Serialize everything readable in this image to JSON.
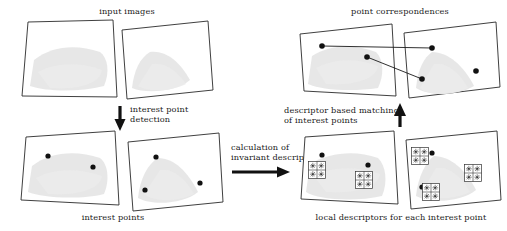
{
  "figure": {
    "background_color": "#ffffff",
    "ink_color": "#1a1a1a",
    "blob_color": "#e3e3e3",
    "width": 507,
    "height": 231
  },
  "captions": {
    "input_images": "input images",
    "interest_points": "interest points",
    "point_correspondences": "point correspondences",
    "local_descriptors": "local descriptors for each interest point",
    "interest_point_detection_line1": "interest point",
    "interest_point_detection_line2": "detection",
    "calculation_line1": "calculation of",
    "calculation_line2": "invariant descriptors",
    "matching_line1": "descriptor based matching",
    "matching_line2": "of interest points"
  },
  "panels": [
    {
      "id": "input-images",
      "caption_key": "input_images",
      "caption_position": "top",
      "quads": [
        {
          "id": "input-left",
          "points": "28,22 113,20 117,97 22,96",
          "blob": "M 34,60 C 52,46 76,44 100,52 C 108,58 110,72 104,86 C 80,92 48,92 30,86 Z"
        },
        {
          "id": "input-right",
          "points": "122,30 208,21 213,90 127,99",
          "blob": "M 150,52 C 166,50 180,62 190,80 C 176,92 146,94 132,88 C 134,70 140,58 150,52 Z"
        }
      ],
      "points": []
    },
    {
      "id": "interest-points",
      "caption_key": "interest_points",
      "caption_position": "bottom",
      "quads": [
        {
          "id": "ip-left",
          "points": "26,137 115,131 119,205 21,200",
          "blob": "M 32,166 C 50,152 76,150 100,158 C 108,164 110,180 104,194 C 80,200 42,198 28,192 Z"
        },
        {
          "id": "ip-right",
          "points": "128,142 219,133 223,202 133,211",
          "blob": "M 158,158 C 174,158 188,172 198,192 C 184,204 152,206 138,198 C 140,178 148,164 158,158 Z"
        }
      ],
      "points": [
        {
          "panel": "ip-left",
          "x": 48,
          "y": 156
        },
        {
          "panel": "ip-left",
          "x": 93,
          "y": 167
        },
        {
          "panel": "ip-right",
          "x": 156,
          "y": 157
        },
        {
          "panel": "ip-right",
          "x": 145,
          "y": 190
        },
        {
          "panel": "ip-right",
          "x": 200,
          "y": 183
        }
      ]
    },
    {
      "id": "point-correspondences",
      "caption_key": "point_correspondences",
      "caption_position": "top",
      "quads": [
        {
          "id": "pc-left",
          "points": "300,34 392,24 396,96 304,91",
          "blob": "M 312,56 C 330,44 356,44 376,52 C 384,60 384,76 378,88 C 352,92 320,90 308,84 Z"
        },
        {
          "id": "pc-right",
          "points": "404,33 496,22 500,87 409,98",
          "blob": "M 432,52 C 448,52 464,66 474,86 C 458,96 428,96 416,88 C 418,68 424,58 432,52 Z"
        }
      ],
      "points": [
        {
          "panel": "pc-left",
          "x": 322,
          "y": 46
        },
        {
          "panel": "pc-left",
          "x": 367,
          "y": 57
        },
        {
          "panel": "pc-right",
          "x": 432,
          "y": 48
        },
        {
          "panel": "pc-right",
          "x": 422,
          "y": 79
        },
        {
          "panel": "pc-right",
          "x": 476,
          "y": 71
        }
      ],
      "correspondence_lines": [
        {
          "from_x": 322,
          "from_y": 46,
          "to_x": 432,
          "to_y": 48
        },
        {
          "from_x": 367,
          "from_y": 57,
          "to_x": 422,
          "to_y": 79
        }
      ]
    },
    {
      "id": "local-descriptors",
      "caption_key": "local_descriptors",
      "caption_position": "bottom",
      "quads": [
        {
          "id": "ld-left",
          "points": "305,137 394,131 398,204 301,199",
          "blob": "M 310,164 C 330,152 356,150 378,158 C 386,166 388,182 382,196 C 356,202 318,200 306,192 Z"
        },
        {
          "id": "ld-right",
          "points": "406,140 497,131 501,200 411,209",
          "blob": "M 434,156 C 450,156 466,170 476,190 C 462,202 430,204 416,196 C 418,176 426,162 434,156 Z"
        }
      ],
      "points": [
        {
          "panel": "ld-left",
          "x": 322,
          "y": 155
        },
        {
          "panel": "ld-left",
          "x": 368,
          "y": 165
        },
        {
          "panel": "ld-right",
          "x": 432,
          "y": 153
        },
        {
          "panel": "ld-right",
          "x": 422,
          "y": 187
        },
        {
          "panel": "ld-right",
          "x": 476,
          "y": 178
        }
      ],
      "descriptors": [
        {
          "panel": "ld-left",
          "cx": 317,
          "cy": 170,
          "grid": 2
        },
        {
          "panel": "ld-left",
          "cx": 364,
          "cy": 180,
          "grid": 2
        },
        {
          "panel": "ld-right",
          "cx": 420,
          "cy": 156,
          "grid": 2
        },
        {
          "panel": "ld-right",
          "cx": 431,
          "cy": 192,
          "grid": 2
        },
        {
          "panel": "ld-right",
          "cx": 473,
          "cy": 173,
          "grid": 2
        }
      ]
    }
  ],
  "arrows": [
    {
      "id": "arrow-detection",
      "direction": "down",
      "label_key_1": "interest_point_detection_line1",
      "label_key_2": "interest_point_detection_line2",
      "x": 120,
      "y1": 106,
      "y2": 128
    },
    {
      "id": "arrow-calculation",
      "direction": "right",
      "label_key_1": "calculation_line1",
      "label_key_2": "calculation_line2",
      "y": 172,
      "x1": 232,
      "x2": 290
    },
    {
      "id": "arrow-matching",
      "direction": "up",
      "label_key_1": "matching_line1",
      "label_key_2": "matching_line2",
      "x": 400,
      "y1": 125,
      "y2": 104
    }
  ],
  "descriptor_cell_glyph": "oriented-gradient-star"
}
